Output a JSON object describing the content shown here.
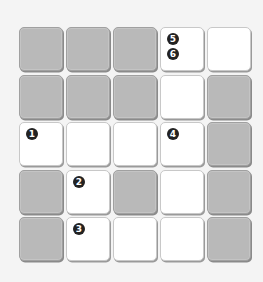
{
  "puzzle": {
    "rows": 5,
    "cols": 5,
    "colors": {
      "white": "#ffffff",
      "gray": "#b9b9b9",
      "badge": "#222222",
      "background": "#f4f4f4"
    },
    "cells": [
      [
        {
          "type": "gray",
          "numbers": []
        },
        {
          "type": "gray",
          "numbers": []
        },
        {
          "type": "gray",
          "numbers": []
        },
        {
          "type": "white",
          "numbers": [
            "5",
            "6"
          ]
        },
        {
          "type": "white",
          "numbers": []
        }
      ],
      [
        {
          "type": "gray",
          "numbers": []
        },
        {
          "type": "gray",
          "numbers": []
        },
        {
          "type": "gray",
          "numbers": []
        },
        {
          "type": "white",
          "numbers": []
        },
        {
          "type": "gray",
          "numbers": []
        }
      ],
      [
        {
          "type": "white",
          "numbers": [
            "1"
          ]
        },
        {
          "type": "white",
          "numbers": []
        },
        {
          "type": "white",
          "numbers": []
        },
        {
          "type": "white",
          "numbers": [
            "4"
          ]
        },
        {
          "type": "gray",
          "numbers": []
        }
      ],
      [
        {
          "type": "gray",
          "numbers": []
        },
        {
          "type": "white",
          "numbers": [
            "2"
          ]
        },
        {
          "type": "gray",
          "numbers": []
        },
        {
          "type": "white",
          "numbers": []
        },
        {
          "type": "gray",
          "numbers": []
        }
      ],
      [
        {
          "type": "gray",
          "numbers": []
        },
        {
          "type": "white",
          "numbers": [
            "3"
          ]
        },
        {
          "type": "white",
          "numbers": []
        },
        {
          "type": "white",
          "numbers": []
        },
        {
          "type": "gray",
          "numbers": []
        }
      ]
    ]
  }
}
